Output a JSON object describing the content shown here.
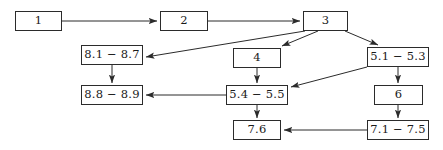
{
  "diagram": {
    "canvas": {
      "width": 443,
      "height": 150,
      "background": "#ffffff"
    },
    "style": {
      "node_border": "#2b2b2b",
      "node_fill": "#ffffff",
      "edge_color": "#2b2b2b",
      "text_color": "#1a1a1a"
    },
    "nodes": [
      {
        "id": "n1",
        "label": "1",
        "x": 15,
        "y": 11,
        "w": 47,
        "h": 20
      },
      {
        "id": "n2",
        "label": "2",
        "x": 160,
        "y": 11,
        "w": 48,
        "h": 20
      },
      {
        "id": "n3",
        "label": "3",
        "x": 303,
        "y": 11,
        "w": 45,
        "h": 20
      },
      {
        "id": "n81",
        "label": "8.1 − 8.7",
        "x": 81,
        "y": 45,
        "w": 62,
        "h": 20
      },
      {
        "id": "n4",
        "label": "4",
        "x": 233,
        "y": 48,
        "w": 48,
        "h": 20
      },
      {
        "id": "n51",
        "label": "5.1 − 5.3",
        "x": 367,
        "y": 47,
        "w": 62,
        "h": 20
      },
      {
        "id": "n88",
        "label": "8.8 − 8.9",
        "x": 81,
        "y": 85,
        "w": 62,
        "h": 20
      },
      {
        "id": "n54",
        "label": "5.4 − 5.5",
        "x": 226,
        "y": 85,
        "w": 62,
        "h": 20
      },
      {
        "id": "n6",
        "label": "6",
        "x": 374,
        "y": 85,
        "w": 49,
        "h": 20
      },
      {
        "id": "n76",
        "label": "7.6",
        "x": 233,
        "y": 120,
        "w": 48,
        "h": 20
      },
      {
        "id": "n71",
        "label": "7.1 − 7.5",
        "x": 367,
        "y": 120,
        "w": 62,
        "h": 20
      }
    ],
    "edges": [
      {
        "id": "e1",
        "from": "n1",
        "to": "n2",
        "points": "62,21 157,21"
      },
      {
        "id": "e2",
        "from": "n2",
        "to": "n3",
        "points": "208,21 300,21"
      },
      {
        "id": "e3",
        "from": "n3",
        "to": "n81",
        "points": "305,31 146,57"
      },
      {
        "id": "e4",
        "from": "n3",
        "to": "n4",
        "points": "318,31 282,46"
      },
      {
        "id": "e5",
        "from": "n3",
        "to": "n51",
        "points": "345,31 378,45"
      },
      {
        "id": "e6",
        "from": "n81",
        "to": "n88",
        "points": "112,65 112,83"
      },
      {
        "id": "e7",
        "from": "n4",
        "to": "n54",
        "points": "257,68 257,83"
      },
      {
        "id": "e8",
        "from": "n51",
        "to": "n54",
        "points": "367,67 291,87"
      },
      {
        "id": "e9",
        "from": "n54",
        "to": "n88",
        "points": "226,95 146,95"
      },
      {
        "id": "e10",
        "from": "n51",
        "to": "n6",
        "points": "398,67 398,83"
      },
      {
        "id": "e11",
        "from": "n54",
        "to": "n76",
        "points": "257,105 257,118"
      },
      {
        "id": "e12",
        "from": "n6",
        "to": "n71",
        "points": "398,105 398,118"
      },
      {
        "id": "e13",
        "from": "n71",
        "to": "n76",
        "points": "367,130 284,130"
      }
    ]
  }
}
